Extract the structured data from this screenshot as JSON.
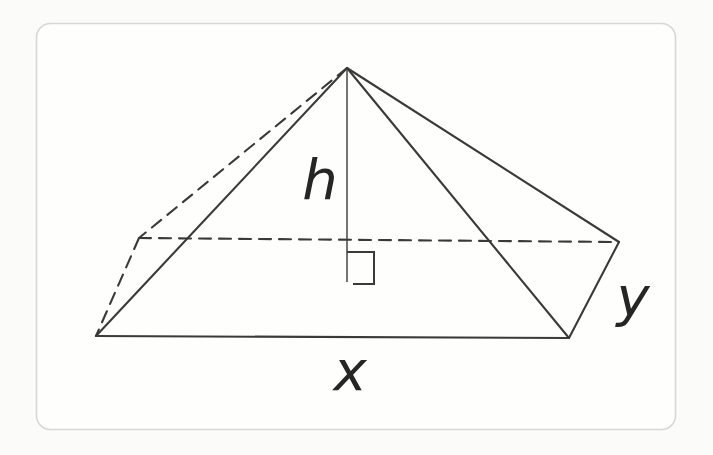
{
  "figure": {
    "kind": "rectangular-pyramid",
    "labels": {
      "height": "h",
      "base_front": "x",
      "base_side": "y"
    }
  },
  "colors": {
    "line": "#3a3a3a",
    "label": "#262626",
    "frame_border": "#d8d7d3",
    "background": "#fbfbf9",
    "canvas": "#fefefd"
  },
  "geometry": {
    "edges": {
      "apex_to_front_left": "M347,68 L96,336",
      "apex_to_front_right": "M347,68 L569,338",
      "apex_to_back_right": "M347,68 L619,242",
      "front_left_to_front_right": "M96,336 L569,338",
      "front_right_to_back_right": "M569,338 L619,242",
      "apex_to_back_left_hidden": "M347,68 L139,238",
      "back_left_to_front_left_hidden": "M139,238 L96,336",
      "back_left_to_back_right_hidden": "M139,238 L619,242",
      "altitude": "M347,68 L347,282",
      "right_angle_marker": "M347,252 L374,252 L374,284 L353,284"
    }
  }
}
